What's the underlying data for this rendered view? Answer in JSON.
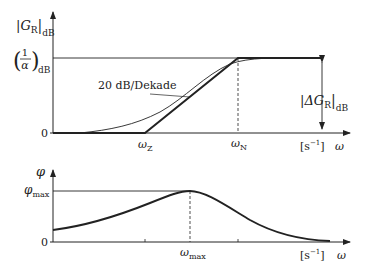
{
  "figure": {
    "upper_plot": {
      "y_axis_label": "|G",
      "y_axis_sub": "R",
      "y_axis_unit": "dB",
      "level_label_num": "1",
      "level_label_den": "α",
      "level_label_unit": "dB",
      "zero_label": "0",
      "slope_label": "20 dB/Dekade",
      "omega_z_label": "ω",
      "omega_z_sub": "Z",
      "omega_n_label": "ω",
      "omega_n_sub": "N",
      "unit_label": "[s",
      "unit_exp": "−1",
      "unit_close": "]",
      "x_axis_label": "ω",
      "delta_label": "|ΔG",
      "delta_sub": "R",
      "delta_unit": "dB"
    },
    "lower_plot": {
      "y_axis_label": "φ",
      "max_label": "φ",
      "max_sub": "max",
      "zero_label": "0",
      "omega_max_label": "ω",
      "omega_max_sub": "max",
      "unit_label": "[s",
      "unit_exp": "−1",
      "unit_close": "]",
      "x_axis_label": "ω"
    },
    "colors": {
      "line": "#222222",
      "background": "#ffffff"
    }
  }
}
